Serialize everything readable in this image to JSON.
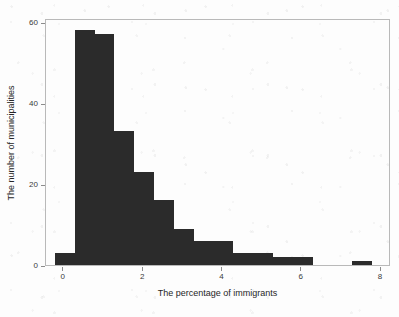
{
  "chart_data": {
    "type": "bar",
    "title": "",
    "subtitle": "",
    "xlabel": "The percentage of immigrants",
    "ylabel": "The number of municipalities",
    "xlim": [
      -0.45,
      8.25
    ],
    "ylim": [
      0,
      61
    ],
    "grid": false,
    "legend": null,
    "bin_width": 0.5,
    "bin_edges": [
      -0.2,
      0.3,
      0.8,
      1.3,
      1.8,
      2.3,
      2.8,
      3.3,
      3.8,
      4.3,
      4.8,
      5.3,
      5.8,
      6.3,
      6.8,
      7.3,
      7.8
    ],
    "categories": [
      "-0.2",
      "0.3",
      "0.8",
      "1.3",
      "1.8",
      "2.3",
      "2.8",
      "3.3",
      "3.8",
      "4.3",
      "4.8",
      "5.3",
      "5.8",
      "6.3",
      "6.8",
      "7.3"
    ],
    "values": [
      3,
      58,
      57,
      33,
      23,
      16,
      9,
      6,
      6,
      3,
      3,
      2,
      2,
      0,
      0,
      1
    ],
    "xticks": [
      0,
      2,
      4,
      6,
      8
    ],
    "xtick_labels": [
      "0",
      "2",
      "4",
      "6",
      "8"
    ],
    "yticks": [
      0,
      20,
      40,
      60
    ],
    "ytick_labels": [
      "0",
      "20",
      "40",
      "60"
    ],
    "bar_color": "#2b2b2b",
    "frame_color": "#b9b9b9",
    "background_color": "#fdfdfd"
  }
}
